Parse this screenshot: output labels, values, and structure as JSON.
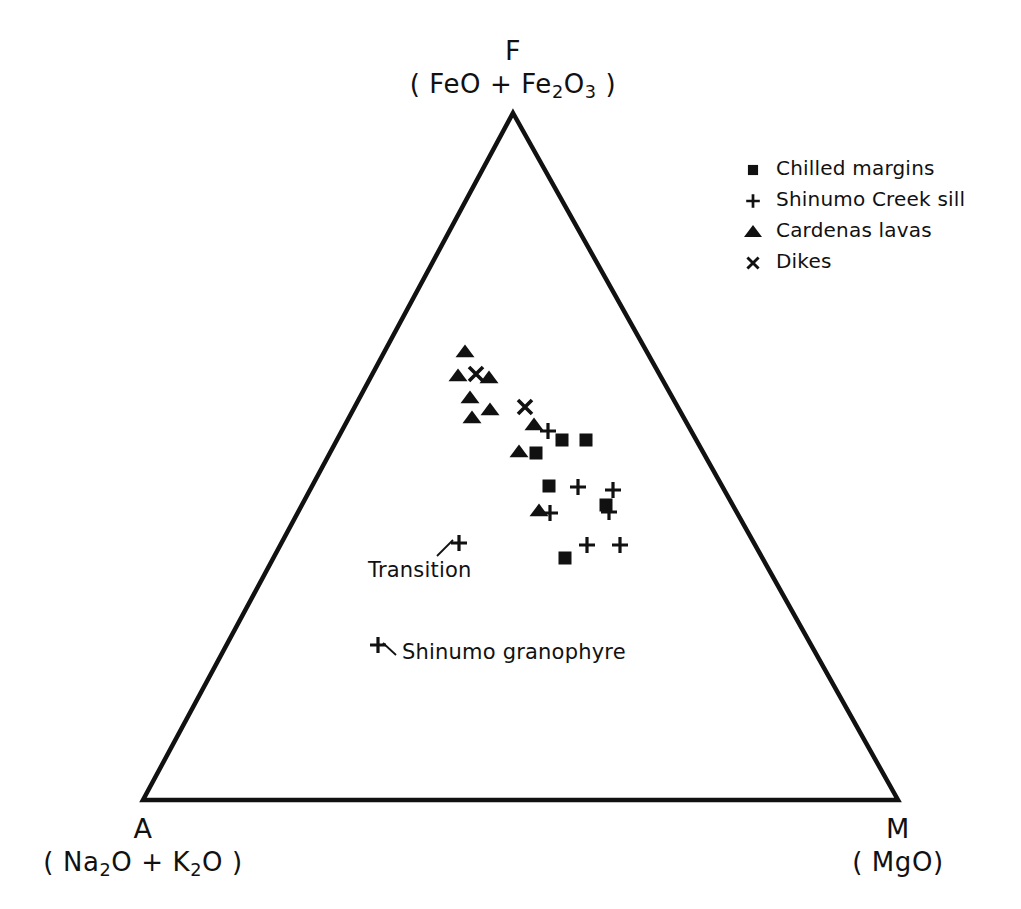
{
  "figure": {
    "type": "afm-ternary-diagram",
    "width": 1021,
    "height": 909,
    "background": "#ffffff",
    "ink_color": "#111111"
  },
  "vertices": {
    "top": {
      "letter": "F",
      "formula_pre": "( FeO + Fe",
      "formula_sub1": "2",
      "formula_mid": "O",
      "formula_sub2": "3",
      "formula_post": " )",
      "x": 513,
      "y": 113
    },
    "bottom_left": {
      "letter": "A",
      "formula_pre": "( Na",
      "formula_sub1": "2",
      "formula_mid": "O + K",
      "formula_sub2": "2",
      "formula_post": "O )",
      "x": 143,
      "y": 800
    },
    "bottom_right": {
      "letter": "M",
      "formula": "( MgO)",
      "x": 898,
      "y": 800
    }
  },
  "legend": {
    "x": 740,
    "y": 155,
    "items": [
      {
        "symbol": "square",
        "label": "Chilled margins"
      },
      {
        "symbol": "plus",
        "label": "Shinumo Creek sill"
      },
      {
        "symbol": "triangle",
        "label": "Cardenas lavas"
      },
      {
        "symbol": "cross",
        "label": "Dikes"
      }
    ]
  },
  "annotations": [
    {
      "name": "transition",
      "text": "Transition",
      "x": 368,
      "y": 558,
      "leader": {
        "from_x": 437,
        "from_y": 556,
        "to_x": 453,
        "to_y": 540
      },
      "marker": {
        "symbol": "plus",
        "x": 459,
        "y": 543
      }
    },
    {
      "name": "shinumo-granophyre",
      "text": "Shinumo granophyre",
      "x": 402,
      "y": 640,
      "leader": {
        "from_x": 396,
        "from_y": 655,
        "to_x": 383,
        "to_y": 643
      },
      "marker": {
        "symbol": "plus",
        "x": 378,
        "y": 645
      }
    }
  ],
  "chart_data": {
    "type": "scatter",
    "title": "",
    "xlabel": "",
    "ylabel": "",
    "projection": "ternary",
    "axes": {
      "F": "FeO + Fe2O3",
      "A": "Na2O + K2O",
      "M": "MgO"
    },
    "grid": false,
    "legend_position": "top-right",
    "series": [
      {
        "name": "Chilled margins",
        "symbol": "square",
        "points_px": [
          [
            562,
            440
          ],
          [
            586,
            440
          ],
          [
            536,
            453
          ],
          [
            549,
            486
          ],
          [
            606,
            505
          ],
          [
            565,
            558
          ]
        ]
      },
      {
        "name": "Shinumo Creek sill",
        "symbol": "plus",
        "points_px": [
          [
            548,
            431
          ],
          [
            578,
            487
          ],
          [
            613,
            490
          ],
          [
            609,
            512
          ],
          [
            550,
            513
          ],
          [
            587,
            545
          ],
          [
            620,
            545
          ],
          [
            459,
            543
          ],
          [
            378,
            645
          ]
        ]
      },
      {
        "name": "Cardenas lavas",
        "symbol": "triangle",
        "points_px": [
          [
            465,
            352
          ],
          [
            458,
            376
          ],
          [
            489,
            378
          ],
          [
            470,
            398
          ],
          [
            490,
            410
          ],
          [
            472,
            418
          ],
          [
            534,
            425
          ],
          [
            519,
            452
          ],
          [
            539,
            511
          ]
        ]
      },
      {
        "name": "Dikes",
        "symbol": "cross",
        "points_px": [
          [
            476,
            374
          ],
          [
            525,
            407
          ]
        ]
      }
    ]
  }
}
